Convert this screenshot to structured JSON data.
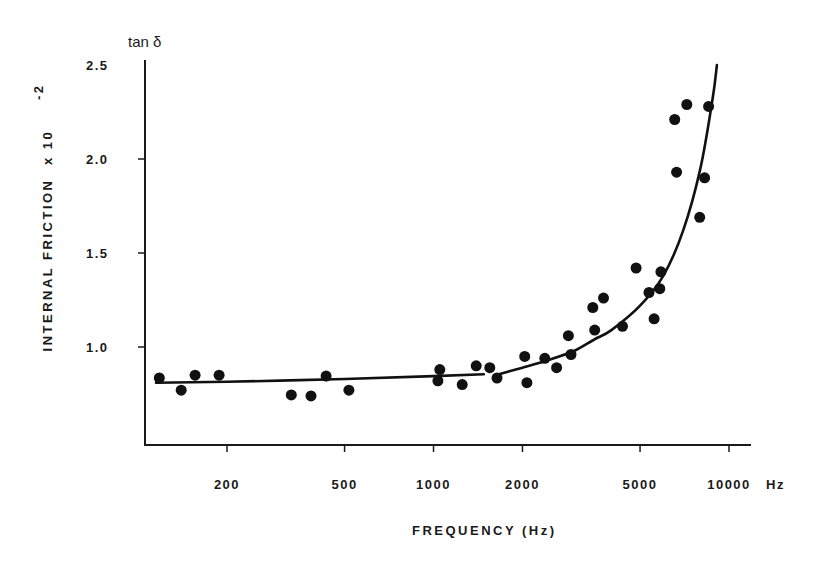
{
  "chart_data": {
    "type": "scatter",
    "title": "",
    "xlabel": "FREQUENCY (Hz)",
    "ylabel": "INTERNAL FRICTION x 10^-2",
    "ylabel_parts": {
      "main": "INTERNAL FRICTION",
      "multiplier": "x 10",
      "exponent": "-2"
    },
    "y_unit_label": "tan δ",
    "x_unit_label": "Hz",
    "xscale": "log",
    "xlim": [
      110,
      12000
    ],
    "ylim": [
      0.48,
      2.5
    ],
    "xticks": [
      200,
      500,
      1000,
      2000,
      5000,
      10000
    ],
    "xtick_labels": [
      "200",
      "500",
      "1000",
      "2000",
      "5000",
      "10000"
    ],
    "yticks": [
      1.0,
      1.5,
      2.0,
      2.5
    ],
    "ytick_labels": [
      "1.0",
      "1.5",
      "2.0",
      "2.5"
    ],
    "grid": false,
    "legend": null,
    "series": [
      {
        "name": "measured",
        "kind": "scatter",
        "points": [
          [
            118,
            0.835
          ],
          [
            140,
            0.77
          ],
          [
            156,
            0.85
          ],
          [
            188,
            0.85
          ],
          [
            330,
            0.745
          ],
          [
            385,
            0.74
          ],
          [
            433,
            0.845
          ],
          [
            517,
            0.77
          ],
          [
            1035,
            0.82
          ],
          [
            1050,
            0.88
          ],
          [
            1250,
            0.8
          ],
          [
            1395,
            0.9
          ],
          [
            1550,
            0.89
          ],
          [
            1640,
            0.835
          ],
          [
            2035,
            0.95
          ],
          [
            2070,
            0.81
          ],
          [
            2380,
            0.94
          ],
          [
            2610,
            0.89
          ],
          [
            2860,
            1.06
          ],
          [
            2920,
            0.96
          ],
          [
            3460,
            1.21
          ],
          [
            3510,
            1.09
          ],
          [
            3760,
            1.26
          ],
          [
            4360,
            1.11
          ],
          [
            4850,
            1.42
          ],
          [
            5360,
            1.29
          ],
          [
            5580,
            1.15
          ],
          [
            5830,
            1.31
          ],
          [
            5880,
            1.4
          ],
          [
            6550,
            2.21
          ],
          [
            6650,
            1.93
          ],
          [
            7200,
            2.29
          ],
          [
            7960,
            1.69
          ],
          [
            8270,
            1.9
          ],
          [
            8530,
            2.28
          ]
        ]
      },
      {
        "name": "fit-curve-low",
        "kind": "line",
        "points": [
          [
            115,
            0.81
          ],
          [
            200,
            0.815
          ],
          [
            500,
            0.83
          ],
          [
            1000,
            0.845
          ],
          [
            1480,
            0.855
          ]
        ]
      },
      {
        "name": "fit-curve-high",
        "kind": "line",
        "points": [
          [
            1620,
            0.85
          ],
          [
            2000,
            0.89
          ],
          [
            2500,
            0.935
          ],
          [
            3000,
            0.98
          ],
          [
            3500,
            1.04
          ],
          [
            4000,
            1.09
          ],
          [
            5000,
            1.22
          ],
          [
            6000,
            1.38
          ],
          [
            7000,
            1.62
          ],
          [
            8000,
            1.95
          ],
          [
            8800,
            2.32
          ],
          [
            9100,
            2.5
          ]
        ]
      }
    ]
  }
}
